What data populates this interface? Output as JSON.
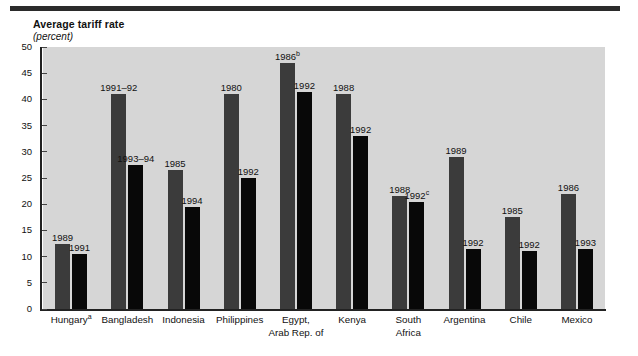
{
  "figure": {
    "title": "Average tariff rate",
    "subtitle": "(percent)"
  },
  "chart_data": {
    "type": "bar",
    "title": "Average tariff rate",
    "subtitle": "(percent)",
    "xlabel": "",
    "ylabel": "percent",
    "ylim": [
      0,
      50
    ],
    "yticks": [
      0,
      5,
      10,
      15,
      20,
      25,
      30,
      35,
      40,
      45,
      50
    ],
    "grid": false,
    "legend": "none",
    "colors": {
      "series1": "#3b3b3b",
      "series2": "#080808",
      "plot_background": "#d6d6d6",
      "axis": "#222222"
    },
    "categories": [
      "Hungary",
      "Bangladesh",
      "Indonesia",
      "Philippines",
      "Egypt, Arab Rep. of",
      "Kenya",
      "South Africa",
      "Argentina",
      "Chile",
      "Mexico"
    ],
    "category_labels": [
      {
        "line1": "Hungary",
        "sup": "a",
        "line2": ""
      },
      {
        "line1": "Bangladesh",
        "sup": "",
        "line2": ""
      },
      {
        "line1": "Indonesia",
        "sup": "",
        "line2": ""
      },
      {
        "line1": "Philippines",
        "sup": "",
        "line2": ""
      },
      {
        "line1": "Egypt,",
        "sup": "",
        "line2": "Arab Rep. of"
      },
      {
        "line1": "Kenya",
        "sup": "",
        "line2": ""
      },
      {
        "line1": "South",
        "sup": "",
        "line2": "Africa"
      },
      {
        "line1": "Argentina",
        "sup": "",
        "line2": ""
      },
      {
        "line1": "Chile",
        "sup": "",
        "line2": ""
      },
      {
        "line1": "Mexico",
        "sup": "",
        "line2": ""
      }
    ],
    "bars": [
      {
        "category": "Hungary",
        "earlier": {
          "label": "1989",
          "sup": "",
          "value": 12.5
        },
        "later": {
          "label": "1991",
          "sup": "",
          "value": 10.5
        }
      },
      {
        "category": "Bangladesh",
        "earlier": {
          "label": "1991–92",
          "sup": "",
          "value": 41.0
        },
        "later": {
          "label": "1993–94",
          "sup": "",
          "value": 27.5
        }
      },
      {
        "category": "Indonesia",
        "earlier": {
          "label": "1985",
          "sup": "",
          "value": 26.5
        },
        "later": {
          "label": "1994",
          "sup": "",
          "value": 19.5
        }
      },
      {
        "category": "Philippines",
        "earlier": {
          "label": "1980",
          "sup": "",
          "value": 41.0
        },
        "later": {
          "label": "1992",
          "sup": "",
          "value": 25.0
        }
      },
      {
        "category": "Egypt, Arab Rep. of",
        "earlier": {
          "label": "1986",
          "sup": "b",
          "value": 47.0
        },
        "later": {
          "label": "1992",
          "sup": "",
          "value": 41.5
        }
      },
      {
        "category": "Kenya",
        "earlier": {
          "label": "1988",
          "sup": "",
          "value": 41.0
        },
        "later": {
          "label": "1992",
          "sup": "",
          "value": 33.0
        }
      },
      {
        "category": "South Africa",
        "earlier": {
          "label": "1988",
          "sup": "",
          "value": 21.5
        },
        "later": {
          "label": "1992",
          "sup": "c",
          "value": 20.5
        }
      },
      {
        "category": "Argentina",
        "earlier": {
          "label": "1989",
          "sup": "",
          "value": 29.0
        },
        "later": {
          "label": "1992",
          "sup": "",
          "value": 11.5
        }
      },
      {
        "category": "Chile",
        "earlier": {
          "label": "1985",
          "sup": "",
          "value": 17.5
        },
        "later": {
          "label": "1992",
          "sup": "",
          "value": 11.0
        }
      },
      {
        "category": "Mexico",
        "earlier": {
          "label": "1986",
          "sup": "",
          "value": 22.0
        },
        "later": {
          "label": "1993",
          "sup": "",
          "value": 11.5
        }
      }
    ]
  }
}
